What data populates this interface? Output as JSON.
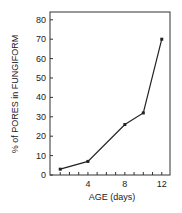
{
  "chart_data": {
    "type": "line",
    "title": "",
    "xlabel": "AGE (days)",
    "ylabel": "% of PORES in FUNGIFORM",
    "x_ticks": [
      "4",
      "8",
      "12"
    ],
    "y_ticks": [
      "0",
      "10",
      "20",
      "30",
      "40",
      "50",
      "60",
      "70",
      "80"
    ],
    "xlim": [
      0,
      13
    ],
    "ylim": [
      0,
      85
    ],
    "grid": false,
    "series": [
      {
        "name": "fungiform pores",
        "x": [
          1,
          4,
          8,
          10,
          12
        ],
        "y": [
          3,
          7,
          26,
          32,
          70
        ]
      }
    ]
  }
}
